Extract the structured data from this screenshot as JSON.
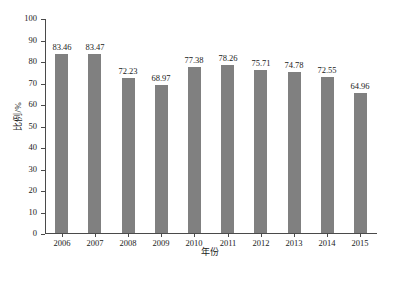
{
  "chart_data": {
    "type": "bar",
    "title": "",
    "xlabel": "年份",
    "ylabel": "比例/%",
    "categories": [
      "2006",
      "2007",
      "2008",
      "2009",
      "2010",
      "2011",
      "2012",
      "2013",
      "2014",
      "2015"
    ],
    "values": [
      83.46,
      83.47,
      72.23,
      68.97,
      77.38,
      78.26,
      75.71,
      74.78,
      72.55,
      64.96
    ],
    "value_labels": [
      "83.46",
      "83.47",
      "72.23",
      "68.97",
      "77.38",
      "78.26",
      "75.71",
      "74.78",
      "72.55",
      "64.96"
    ],
    "ylim": [
      0,
      100
    ],
    "ytick_labels": [
      "0",
      "10",
      "20",
      "30",
      "40",
      "50",
      "60",
      "70",
      "80",
      "90",
      "100"
    ],
    "ytick_values": [
      0,
      10,
      20,
      30,
      40,
      50,
      60,
      70,
      80,
      90,
      100
    ],
    "grid": false,
    "legend": null,
    "series_color": "#808080",
    "axis_color": "#4a4a4a",
    "background": "#ffffff"
  },
  "figure": {
    "caption_partial": ""
  }
}
